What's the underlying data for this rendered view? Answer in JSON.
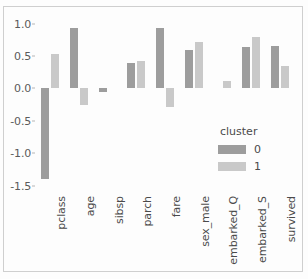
{
  "chart_data": {
    "type": "bar",
    "title": "",
    "xlabel": "",
    "ylabel": "",
    "categories": [
      "pclass",
      "age",
      "sibsp",
      "parch",
      "fare",
      "sex_male",
      "embarked_Q",
      "embarked_S",
      "survived"
    ],
    "series": [
      {
        "name": "0",
        "color": "#9d9d9d",
        "values": [
          -1.4,
          0.94,
          -0.05,
          0.4,
          0.93,
          0.6,
          0.0,
          0.64,
          0.66
        ]
      },
      {
        "name": "1",
        "color": "#c9c9c9",
        "values": [
          0.53,
          -0.25,
          0.0,
          0.42,
          -0.28,
          0.72,
          0.12,
          0.79,
          0.35
        ]
      }
    ],
    "ylim": [
      -1.6,
      1.12
    ],
    "yticks": [
      1.0,
      0.5,
      0.0,
      -0.5,
      -1.0,
      -1.5
    ],
    "ytick_labels": [
      "1.0",
      "0.5",
      "0.0",
      "-0.5",
      "-1.0",
      "-1.5"
    ],
    "grid": false,
    "legend": {
      "title": "cluster",
      "position": "inside-lower-right",
      "entries": [
        {
          "label": "0",
          "color": "#9d9d9d"
        },
        {
          "label": "1",
          "color": "#c9c9c9"
        }
      ]
    }
  }
}
